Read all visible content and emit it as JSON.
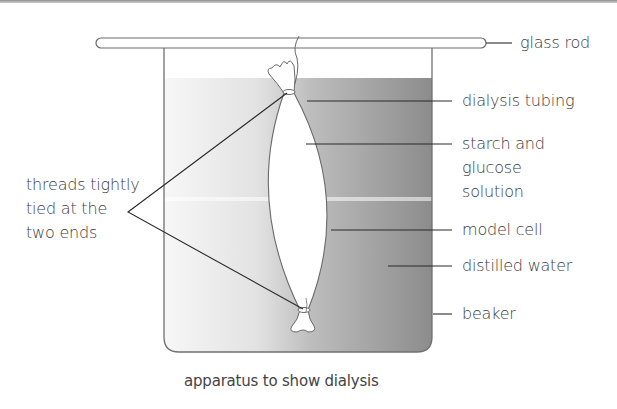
{
  "diagram": {
    "title": "apparatus to show dialysis",
    "labels": {
      "glass_rod": "glass rod",
      "dialysis_tubing": "dialysis tubing",
      "starch_glucose_line1": "starch and",
      "starch_glucose_line2": "glucose",
      "starch_glucose_line3": "solution",
      "model_cell": "model cell",
      "distilled_water": "distilled water",
      "beaker": "beaker",
      "threads_line1": "threads tightly",
      "threads_line2": "tied at the",
      "threads_line3": "two ends"
    },
    "colors": {
      "outline": "#6e6e6e",
      "leader": "#2a2a2a",
      "water_light": "#f4f4f4",
      "water_dark": "#8a8a8a",
      "tubing_fill": "#ffffff"
    },
    "components": [
      "glass rod",
      "thread",
      "dialysis tubing",
      "starch and glucose solution",
      "distilled water",
      "beaker"
    ]
  }
}
